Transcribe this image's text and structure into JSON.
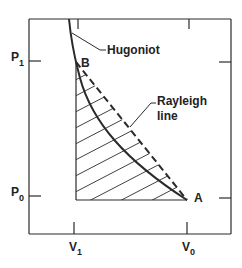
{
  "diagram": {
    "type": "pressure-volume shock diagram",
    "axes": {
      "y_ticks": [
        {
          "label": "P",
          "subscript": "1",
          "y": 61
        },
        {
          "label": "P",
          "subscript": "0",
          "y": 196
        }
      ],
      "x_ticks": [
        {
          "label": "V",
          "subscript": "1",
          "x": 74
        },
        {
          "label": "V",
          "subscript": "0",
          "x": 187
        }
      ]
    },
    "points": {
      "A": {
        "label": "A",
        "x": 187,
        "y": 200
      },
      "B": {
        "label": "B",
        "x": 76,
        "y": 62
      }
    },
    "labels": {
      "hugoniot": "Hugoniot",
      "rayleigh_line_1": "Rayleigh",
      "rayleigh_line_2": "line"
    },
    "colors": {
      "line": "#2a2a2a",
      "background": "#ffffff"
    }
  }
}
